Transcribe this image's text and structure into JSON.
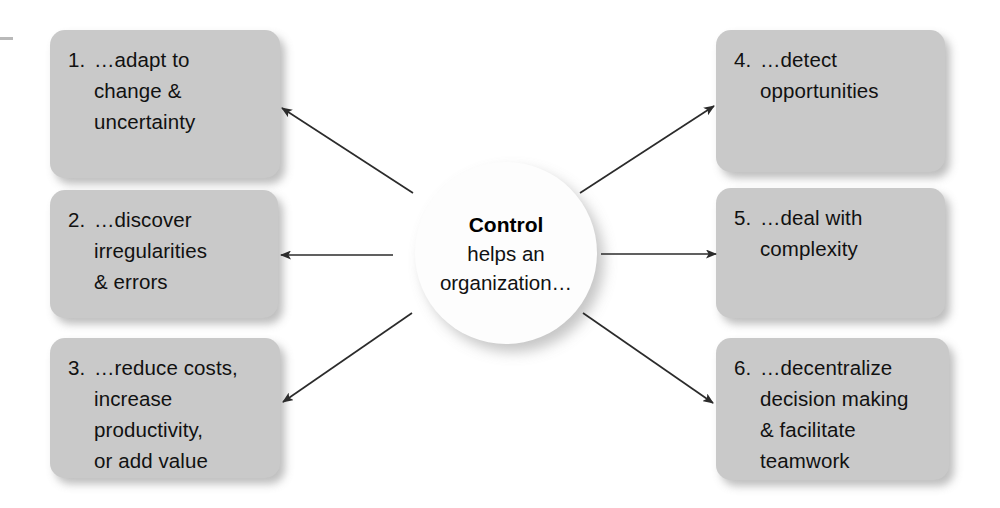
{
  "diagram": {
    "title_visible": false,
    "center": {
      "name": "Control",
      "subtitle": "helps an\norganization…",
      "shape": "circle",
      "fill": "#fdfdfd"
    },
    "box_fill": "#c9c9c9",
    "text_color": "#111111",
    "background": "#ffffff",
    "edge_tick_color": "#b9b9b9",
    "arrow_color": "#2b2b2b",
    "left_boxes": [
      {
        "number": "1.",
        "text": "…adapt to\nchange &\nuncertainty",
        "full": "1. …adapt to change & uncertainty"
      },
      {
        "number": "2.",
        "text": "…discover\nirregularities\n& errors",
        "full": "2. …discover irregularities & errors"
      },
      {
        "number": "3.",
        "text": "…reduce costs,\nincrease\nproductivity,\nor add value",
        "full": "3. …reduce costs, increase productivity, or add value"
      }
    ],
    "right_boxes": [
      {
        "number": "4.",
        "text": "…detect\nopportunities",
        "full": "4. …detect opportunities"
      },
      {
        "number": "5.",
        "text": "…deal with\ncomplexity",
        "full": "5. …deal with complexity"
      },
      {
        "number": "6.",
        "text": "…decentralize\ndecision making\n& facilitate\nteamwork",
        "full": "6. …decentralize decision making & facilitate teamwork"
      }
    ],
    "arrows": [
      {
        "name": "arrow-to-box-1",
        "from": [
          413,
          193
        ],
        "to": [
          282,
          108
        ],
        "direction": "up-left"
      },
      {
        "name": "arrow-to-box-2",
        "from": [
          393,
          255
        ],
        "to": [
          281,
          255
        ],
        "direction": "left"
      },
      {
        "name": "arrow-to-box-3",
        "from": [
          412,
          313
        ],
        "to": [
          283,
          402
        ],
        "direction": "down-left"
      },
      {
        "name": "arrow-to-box-4",
        "from": [
          580,
          193
        ],
        "to": [
          714,
          106
        ],
        "direction": "up-right"
      },
      {
        "name": "arrow-to-box-5",
        "from": [
          601,
          254
        ],
        "to": [
          716,
          254
        ],
        "direction": "right"
      },
      {
        "name": "arrow-to-box-6",
        "from": [
          583,
          313
        ],
        "to": [
          713,
          403
        ],
        "direction": "down-right"
      }
    ]
  }
}
